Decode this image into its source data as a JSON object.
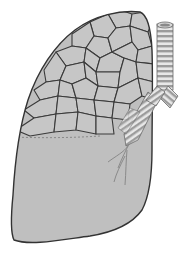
{
  "image": {
    "subject": "lung-illustration",
    "colors": {
      "background": "#ffffff",
      "lung_fill": "#bdbdbd",
      "cell_fill": "#c4c4c4",
      "outline": "#3a3a3a",
      "trachea_light": "#e6e6e6",
      "trachea_dark": "#9a9a9a"
    }
  }
}
